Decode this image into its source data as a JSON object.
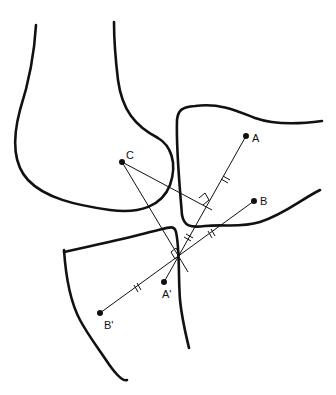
{
  "diagram": {
    "title": "",
    "points": {
      "A": {
        "label": "A",
        "x": 246,
        "y": 136
      },
      "B": {
        "label": "B",
        "x": 254,
        "y": 201
      },
      "C": {
        "label": "C",
        "x": 122,
        "y": 162
      },
      "A_prime": {
        "label": "A'",
        "x": 164,
        "y": 282
      },
      "B_prime": {
        "label": "B'",
        "x": 100,
        "y": 313
      }
    },
    "intersection": {
      "x": 178,
      "y": 258
    },
    "markers": {
      "equal_segments": "double-tick (//) marks on segments A–P, P–A', B–P, P–B'",
      "right_angles": [
        "perpendicular bisector of A–A' meets C line",
        "perpendicular bisector of B–B' at intersection"
      ]
    },
    "colors": {
      "stroke": "#111111",
      "background": "#ffffff"
    }
  }
}
